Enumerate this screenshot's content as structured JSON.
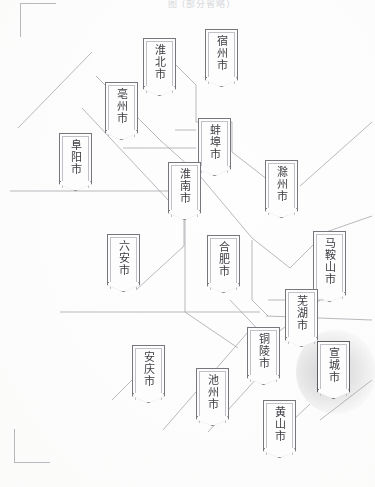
{
  "document": {
    "title": "安徽省地级市分布示意图",
    "header_remnant": "图 (部分省略)",
    "paper_color": "#fefefe",
    "line_color": "#a7a7ad",
    "banner_border_color": "#76767c",
    "text_color": "#3c3c42",
    "highlight_glow_color": "#6e6e73"
  },
  "corner_marks": {
    "top_left_label": "crop-mark-top-left",
    "bottom_left_label": "crop-mark-bottom-left"
  },
  "map": {
    "caption": "安徽省各地级市名称标牌分布",
    "city_count": 16,
    "highlighted_city": "宣城市",
    "cities": [
      {
        "name": "淮北市",
        "pinyin": "Huaibei",
        "x": 143,
        "y": 38,
        "chars": 3,
        "highlighted": false
      },
      {
        "name": "宿州市",
        "pinyin": "Suzhou",
        "x": 205,
        "y": 29,
        "chars": 3,
        "highlighted": false
      },
      {
        "name": "亳州市",
        "pinyin": "Bozhou",
        "x": 105,
        "y": 82,
        "chars": 3,
        "highlighted": false
      },
      {
        "name": "蚌埠市",
        "pinyin": "Bengbu",
        "x": 198,
        "y": 118,
        "chars": 3,
        "highlighted": false
      },
      {
        "name": "阜阳市",
        "pinyin": "Fuyang",
        "x": 59,
        "y": 133,
        "chars": 3,
        "highlighted": false
      },
      {
        "name": "淮南市",
        "pinyin": "Huainan",
        "x": 168,
        "y": 162,
        "chars": 3,
        "highlighted": false
      },
      {
        "name": "滁州市",
        "pinyin": "Chuzhou",
        "x": 265,
        "y": 160,
        "chars": 3,
        "highlighted": false
      },
      {
        "name": "六安市",
        "pinyin": "Lu'an",
        "x": 107,
        "y": 234,
        "chars": 3,
        "highlighted": false
      },
      {
        "name": "合肥市",
        "pinyin": "Hefei",
        "x": 207,
        "y": 235,
        "chars": 3,
        "highlighted": false
      },
      {
        "name": "马鞍山市",
        "pinyin": "Ma'anshan",
        "x": 313,
        "y": 231,
        "chars": 4,
        "highlighted": false
      },
      {
        "name": "芜湖市",
        "pinyin": "Wuhu",
        "x": 285,
        "y": 289,
        "chars": 3,
        "highlighted": false
      },
      {
        "name": "铜陵市",
        "pinyin": "Tongling",
        "x": 247,
        "y": 327,
        "chars": 3,
        "highlighted": false
      },
      {
        "name": "宣城市",
        "pinyin": "Xuancheng",
        "x": 317,
        "y": 341,
        "chars": 3,
        "highlighted": true
      },
      {
        "name": "安庆市",
        "pinyin": "Anqing",
        "x": 132,
        "y": 345,
        "chars": 3,
        "highlighted": false
      },
      {
        "name": "池州市",
        "pinyin": "Chizhou",
        "x": 196,
        "y": 368,
        "chars": 3,
        "highlighted": false
      },
      {
        "name": "黄山市",
        "pinyin": "Huangshan",
        "x": 263,
        "y": 400,
        "chars": 3,
        "highlighted": false
      }
    ],
    "boundary_paths": [
      "M 18 128 L 92 52",
      "M 82 108 L 185 218",
      "M 155 44 L 196 85",
      "M 196 85 L 196 122",
      "M 196 122 L 232 122",
      "M 232 122 L 232 152",
      "M 232 152 L 268 180",
      "M 175 130 L 196 130",
      "M 123 148 L 196 148",
      "M 96 76 L 160 140",
      "M 160 140 L 200 176",
      "M 200 176 L 252 238",
      "M 252 238 L 290 268",
      "M 290 268 L 326 232",
      "M 326 232 L 372 216",
      "M 10 191 L 172 191",
      "M 172 191 L 184 191",
      "M 184 196 L 184 246",
      "M 184 246 L 136 290",
      "M 185 192 L 185 312",
      "M 185 312 L 238 348",
      "M 60 312 L 244 312",
      "M 244 312 L 260 312",
      "M 252 240 L 252 300",
      "M 252 300 L 268 316",
      "M 268 300 L 324 300",
      "M 266 316 L 372 320",
      "M 163 430 L 248 332",
      "M 208 432 L 268 366",
      "M 272 440 L 310 404",
      "M 320 420 L 372 380",
      "M 230 300 L 268 340",
      "M 268 340 L 320 300",
      "M 112 400 L 132 380",
      "M 300 186 L 372 122"
    ]
  }
}
